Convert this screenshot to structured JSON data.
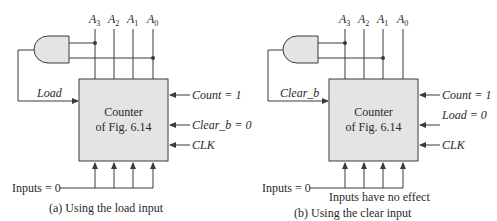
{
  "colors": {
    "line": "#3a3a3a",
    "box_fill": "#e4e4e4",
    "gate_fill": "#e4e4e4",
    "text": "#2a2a2a"
  },
  "panels": [
    {
      "id": "a",
      "outputs": [
        {
          "base": "A",
          "sub": "3"
        },
        {
          "base": "A",
          "sub": "2"
        },
        {
          "base": "A",
          "sub": "1"
        },
        {
          "base": "A",
          "sub": "0"
        }
      ],
      "gate": "AND",
      "gate_taps": [
        "A3",
        "A0"
      ],
      "feedback_label": "Load",
      "box_line1": "Counter",
      "box_line2": "of Fig. 6.14",
      "right_inputs": [
        "Count = 1",
        "Clear_b = 0",
        "CLK"
      ],
      "inputs_label": "Inputs = 0",
      "note": "",
      "caption": "(a) Using the load input"
    },
    {
      "id": "b",
      "outputs": [
        {
          "base": "A",
          "sub": "3"
        },
        {
          "base": "A",
          "sub": "2"
        },
        {
          "base": "A",
          "sub": "1"
        },
        {
          "base": "A",
          "sub": "0"
        }
      ],
      "gate": "AND",
      "gate_taps": [
        "A3",
        "A1"
      ],
      "feedback_label": "Clear_b",
      "box_line1": "Counter",
      "box_line2": "of Fig. 6.14",
      "right_inputs": [
        "Count = 1",
        "Load = 0",
        "CLK"
      ],
      "inputs_label": "Inputs = 0",
      "note": "Inputs have no effect",
      "caption": "(b) Using the clear input"
    }
  ]
}
